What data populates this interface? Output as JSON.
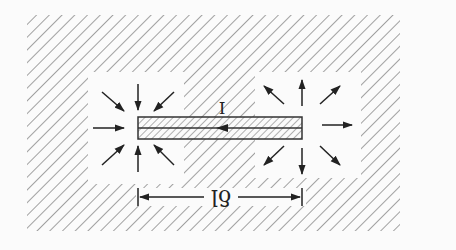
{
  "figure": {
    "type": "dipole current element diagram",
    "colors": {
      "background": "#fbfbfb",
      "hatch": "#8a8a8a",
      "ink": "#222222",
      "cutout": "#fbfbfb"
    },
    "labels": {
      "current": "I",
      "length": "δl"
    },
    "elements": {
      "hatched_region": {
        "x": 27,
        "y": 15,
        "width": 373,
        "height": 216
      },
      "left_cutout": {
        "x": 88,
        "y": 72,
        "width": 96,
        "height": 112
      },
      "right_cutout": {
        "x": 255,
        "y": 72,
        "width": 106,
        "height": 106
      },
      "wire": {
        "x": 138,
        "y": 117,
        "width": 164,
        "height": 22
      },
      "current_arrow_direction": "left",
      "left_end_arrows": "inward (sink)",
      "right_end_arrows": "outward (source)",
      "dimension_line": {
        "x1": 138,
        "x2": 302,
        "y": 197
      }
    }
  }
}
